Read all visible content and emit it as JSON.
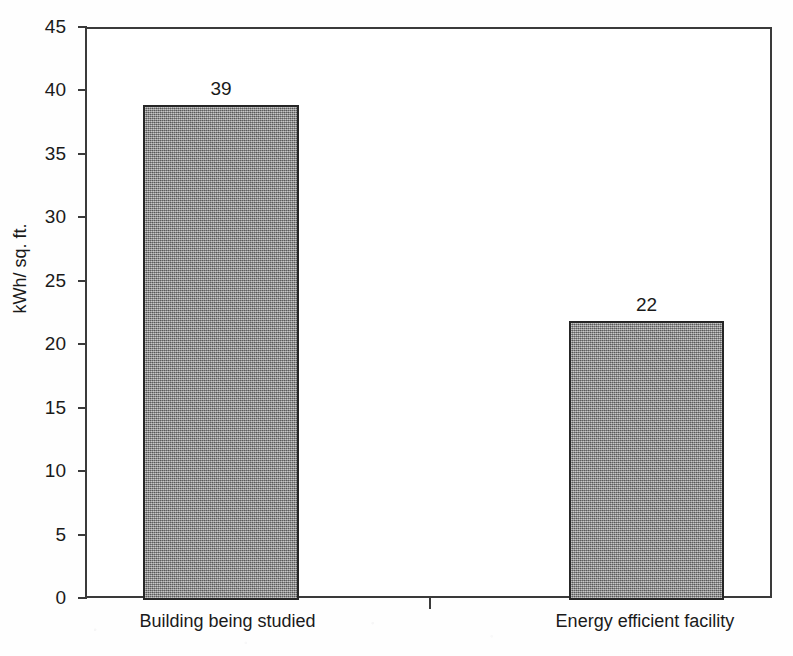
{
  "chart_data": {
    "type": "bar",
    "title": "",
    "xlabel": "",
    "ylabel": "kWh/ sq. ft.",
    "categories": [
      "Building being studied",
      "Energy efficient facility"
    ],
    "values": [
      39,
      22
    ],
    "value_labels": [
      "39",
      "22"
    ],
    "ylim": [
      0,
      45
    ],
    "ytick_step": 5,
    "yticks": [
      45,
      40,
      35,
      30,
      25,
      20,
      15,
      10,
      5,
      0
    ],
    "ytick_labels": [
      "45",
      "40",
      "35",
      "30",
      "25",
      "20",
      "15",
      "10",
      "5",
      "0"
    ],
    "grid": false,
    "legend": null,
    "bar_fill_color": "#8d8d8d",
    "bar_border_color": "#262626",
    "axis_color": "#3a3a3a",
    "background_color": "#ffffff"
  }
}
